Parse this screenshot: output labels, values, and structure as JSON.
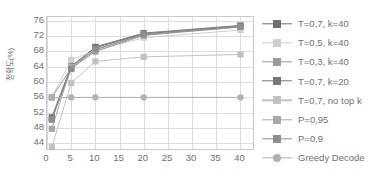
{
  "chart_data": {
    "type": "line",
    "title": "",
    "xlabel": "",
    "ylabel": "정확도(%)",
    "xlim": [
      0,
      43
    ],
    "ylim": [
      42,
      77
    ],
    "xticks": [
      0,
      5,
      10,
      15,
      20,
      25,
      30,
      35,
      40
    ],
    "yticks": [
      44,
      48,
      52,
      56,
      60,
      64,
      68,
      72,
      76
    ],
    "grid": true,
    "legend_position": "right",
    "x": [
      1,
      5,
      10,
      20,
      40
    ],
    "series": [
      {
        "name": "T=0,7, k=40",
        "marker": "square",
        "color": "#6e6e6e",
        "values": [
          50.8,
          64.2,
          69.0,
          72.6,
          74.6
        ]
      },
      {
        "name": "T=0,5, k=40",
        "marker": "square",
        "color": "#cfcfcf",
        "values": [
          56.0,
          65.8,
          68.2,
          71.6,
          73.6
        ]
      },
      {
        "name": "T=0,3, k=40",
        "marker": "square",
        "color": "#9a9a9a",
        "values": [
          56.0,
          63.6,
          68.0,
          72.2,
          74.4
        ]
      },
      {
        "name": "T=0,7, k=20",
        "marker": "square",
        "color": "#777777",
        "values": [
          50.2,
          63.8,
          69.2,
          72.8,
          74.8
        ]
      },
      {
        "name": "T=0,7, no top k",
        "marker": "square",
        "color": "#c2c2c2",
        "values": [
          43.0,
          59.8,
          65.4,
          66.6,
          67.2
        ]
      },
      {
        "name": "P=0,95",
        "marker": "square",
        "color": "#a8a8a8",
        "values": [
          47.8,
          64.0,
          68.4,
          72.4,
          74.4
        ]
      },
      {
        "name": "P=0,9",
        "marker": "square",
        "color": "#8e8e8e",
        "values": [
          50.4,
          63.4,
          68.6,
          72.4,
          74.5
        ]
      },
      {
        "name": "Greedy Decode",
        "marker": "circle",
        "color": "#b0b0b0",
        "values": [
          56.0,
          56.0,
          56.0,
          56.0,
          56.0
        ]
      }
    ]
  },
  "axis": {
    "y_title": "정확도(%)",
    "y_tick_labels": [
      "76",
      "72",
      "68",
      "64",
      "60",
      "56",
      "52",
      "48",
      "44"
    ],
    "x_tick_labels": [
      "0",
      "5",
      "10",
      "15",
      "20",
      "25",
      "30",
      "35",
      "40"
    ]
  },
  "legend": {
    "items": [
      {
        "label": "T=0,7, k=40"
      },
      {
        "label": "T=0,5, k=40"
      },
      {
        "label": "T=0,3, k=40"
      },
      {
        "label": "T=0,7, k=20"
      },
      {
        "label": "T=0,7, no top k"
      },
      {
        "label": "P=0,95"
      },
      {
        "label": "P=0,9"
      },
      {
        "label": "Greedy Decode"
      }
    ]
  },
  "caption": {
    "text": ""
  }
}
